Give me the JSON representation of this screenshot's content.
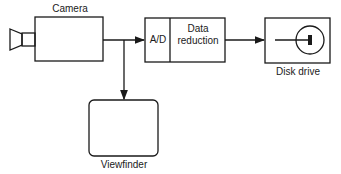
{
  "diagram": {
    "camera": {
      "label": "Camera"
    },
    "processor": {
      "ad_label": "A/D",
      "reduction_label_1": "Data",
      "reduction_label_2": "reduction"
    },
    "disk": {
      "label": "Disk drive"
    },
    "viewfinder": {
      "label": "Viewfinder"
    },
    "colors": {
      "stroke": "#1a1a1a",
      "background": "#ffffff"
    }
  }
}
